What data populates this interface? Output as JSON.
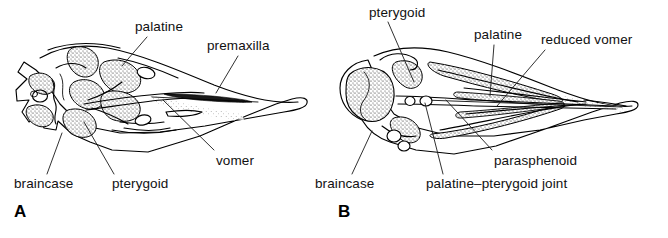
{
  "figure": {
    "type": "anatomical-line-drawing",
    "background_color": "#ffffff",
    "ink_color": "#000000",
    "panel_count": 2
  },
  "panels": [
    {
      "id": "A",
      "letter": "A",
      "palate_type": "paleognathous",
      "labels": [
        {
          "id": "palatine",
          "text": "palatine",
          "x": 135,
          "y": 20,
          "anchor": "start",
          "leader": {
            "x1": 147,
            "y1": 37,
            "x2": 122,
            "y2": 66
          }
        },
        {
          "id": "premaxilla",
          "text": "premaxilla",
          "x": 207,
          "y": 39,
          "anchor": "start",
          "leader": {
            "x1": 238,
            "y1": 56,
            "x2": 216,
            "y2": 93
          }
        },
        {
          "id": "vomer",
          "text": "vomer",
          "x": 216,
          "y": 154,
          "anchor": "start",
          "leader": {
            "x1": 214,
            "y1": 150,
            "x2": 163,
            "y2": 100
          }
        },
        {
          "id": "braincase",
          "text": "braincase",
          "x": 14,
          "y": 177,
          "anchor": "start",
          "leader": {
            "x1": 47,
            "y1": 174,
            "x2": 62,
            "y2": 133
          }
        },
        {
          "id": "pterygoid",
          "text": "pterygoid",
          "x": 112,
          "y": 177,
          "anchor": "start",
          "leader": {
            "x1": 114,
            "y1": 174,
            "x2": 84,
            "y2": 122
          }
        }
      ],
      "panel_letter_pos": {
        "x": 14,
        "y": 203
      }
    },
    {
      "id": "B",
      "letter": "B",
      "palate_type": "neognathous",
      "labels": [
        {
          "id": "pterygoid",
          "text": "pterygoid",
          "x": 369,
          "y": 6,
          "anchor": "start",
          "leader": {
            "x1": 388,
            "y1": 22,
            "x2": 414,
            "y2": 82
          }
        },
        {
          "id": "palatine",
          "text": "palatine",
          "x": 474,
          "y": 28,
          "anchor": "start",
          "leader": {
            "x1": 494,
            "y1": 45,
            "x2": 490,
            "y2": 96
          }
        },
        {
          "id": "reduced-vomer",
          "text": "reduced vomer",
          "x": 541,
          "y": 33,
          "anchor": "start",
          "leader": {
            "x1": 545,
            "y1": 50,
            "x2": 497,
            "y2": 106
          }
        },
        {
          "id": "parasphenoid",
          "text": "parasphenoid",
          "x": 494,
          "y": 154,
          "anchor": "start",
          "leader": {
            "x1": 492,
            "y1": 150,
            "x2": 446,
            "y2": 100
          }
        },
        {
          "id": "braincase",
          "text": "braincase",
          "x": 315,
          "y": 177,
          "anchor": "start",
          "leader": {
            "x1": 352,
            "y1": 174,
            "x2": 372,
            "y2": 131
          }
        },
        {
          "id": "palatine-pterygoid-joint",
          "text": "palatine–pterygoid joint",
          "x": 426,
          "y": 177,
          "anchor": "start",
          "leader": {
            "x1": 443,
            "y1": 174,
            "x2": 425,
            "y2": 103
          }
        }
      ],
      "panel_letter_pos": {
        "x": 338,
        "y": 203
      }
    }
  ]
}
